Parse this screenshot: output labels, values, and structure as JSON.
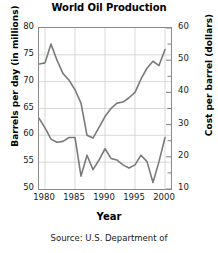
{
  "chart_data": {
    "type": "line",
    "title": "World Oil Production",
    "xlabel": "Year",
    "ylabel": "Barrels per day (in millions)",
    "ylabel_right": "Cost per barrel (dollars)",
    "source": "Source: U.S. Department of",
    "grid": true,
    "legend": "none",
    "xlim": [
      1979,
      2001
    ],
    "ylim": [
      50,
      80
    ],
    "ylim_right": [
      10,
      60
    ],
    "xticks": [
      1980,
      1985,
      1990,
      1995,
      2000
    ],
    "yticks_left": [
      50,
      55,
      60,
      65,
      70,
      75,
      80
    ],
    "yticks_right": [
      10,
      20,
      30,
      40,
      50,
      60
    ],
    "yticks_right_minor": [
      15,
      25,
      35,
      45,
      55
    ],
    "x": [
      1979,
      1980,
      1981,
      1982,
      1983,
      1984,
      1985,
      1986,
      1987,
      1988,
      1989,
      1990,
      1991,
      1992,
      1993,
      1994,
      1995,
      1996,
      1997,
      1998,
      1999,
      2000
    ],
    "series": [
      {
        "name": "Barrels per day (in millions)",
        "axis": "left",
        "color": "#7a7a7a",
        "values": [
          73.3,
          73.5,
          77.0,
          74.0,
          71.5,
          70.3,
          68.5,
          66.0,
          60.0,
          59.5,
          61.5,
          63.5,
          65.0,
          66.0,
          66.2,
          67.0,
          68.0,
          70.5,
          72.5,
          73.8,
          73.0,
          76.0
        ]
      },
      {
        "name": "Cost per barrel (dollars)",
        "axis": "right",
        "color": "#7a7a7a",
        "values": [
          32.0,
          29.0,
          25.5,
          24.5,
          24.8,
          26.0,
          26.0,
          14.0,
          20.5,
          16.0,
          19.0,
          22.5,
          19.5,
          19.0,
          17.5,
          16.5,
          17.5,
          20.5,
          18.5,
          12.0,
          18.5,
          26.0
        ]
      }
    ]
  },
  "axis_labels": {
    "y_left": [
      "80",
      "75",
      "70",
      "65",
      "60",
      "55",
      "50"
    ],
    "y_right": [
      "60",
      "50",
      "40",
      "30",
      "20",
      "10"
    ],
    "x": [
      "1980",
      "1985",
      "1990",
      "1995",
      "2000"
    ]
  }
}
